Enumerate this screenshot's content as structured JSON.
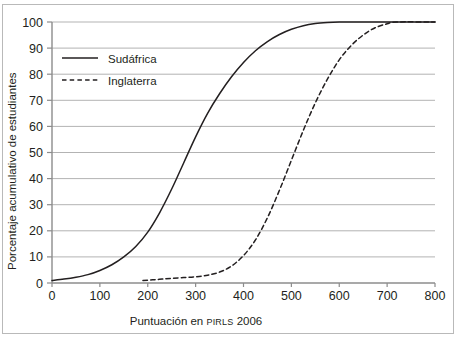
{
  "chart_data": {
    "type": "line",
    "title": "",
    "subtitle": "",
    "xlabel_prefix": "Puntuación en ",
    "xlabel_smallcaps": "PIRLS",
    "xlabel_suffix": " 2006",
    "xlabel": "Puntuación en PIRLS 2006",
    "ylabel": "Porcentaje acumulativo de estudiantes",
    "xlim": [
      0,
      800
    ],
    "ylim": [
      0,
      100
    ],
    "xticks": [
      0,
      100,
      200,
      300,
      400,
      500,
      600,
      700,
      800
    ],
    "xtick_labels": [
      "0",
      "100",
      "200",
      "300",
      "400",
      "500",
      "600",
      "700",
      "800"
    ],
    "yticks": [
      0,
      10,
      20,
      30,
      40,
      50,
      60,
      70,
      80,
      90,
      100
    ],
    "ytick_labels": [
      "0",
      "10",
      "20",
      "30",
      "40",
      "50",
      "60",
      "70",
      "80",
      "90",
      "100"
    ],
    "grid": "horizontal",
    "grid_color": "#b3b3b3",
    "axis_color": "#8c8c8c",
    "line_color": "#231f20",
    "legend_position": "top-left",
    "series": [
      {
        "name": "Sudáfrica",
        "style": "solid",
        "color": "#231f20",
        "x": [
          0,
          25,
          50,
          75,
          100,
          125,
          150,
          175,
          200,
          225,
          250,
          275,
          300,
          325,
          350,
          375,
          400,
          425,
          450,
          475,
          500,
          525,
          550,
          575,
          600,
          625,
          640,
          700,
          800
        ],
        "y": [
          1,
          1.5,
          2.2,
          3.2,
          4.8,
          7,
          10,
          14,
          19.5,
          27,
          36,
          46,
          56,
          65,
          72.5,
          79,
          84.5,
          89,
          92.5,
          95.2,
          97.2,
          98.6,
          99.4,
          99.8,
          100,
          100,
          100,
          100,
          100
        ]
      },
      {
        "name": "Inglaterra",
        "style": "dashed",
        "color": "#231f20",
        "x": [
          190,
          210,
          230,
          250,
          275,
          300,
          325,
          350,
          375,
          400,
          425,
          450,
          475,
          500,
          525,
          550,
          575,
          600,
          625,
          650,
          675,
          700,
          720,
          800
        ],
        "y": [
          1,
          1.2,
          1.5,
          1.8,
          2.1,
          2.4,
          3,
          4.2,
          6.5,
          10.5,
          16.5,
          25,
          35.5,
          47,
          58.5,
          69,
          78,
          85.5,
          91,
          95,
          97.8,
          99.3,
          100,
          100
        ]
      }
    ]
  },
  "legend": {
    "items": [
      {
        "label": "Sudáfrica",
        "style": "solid"
      },
      {
        "label": "Inglaterra",
        "style": "dashed"
      }
    ]
  }
}
